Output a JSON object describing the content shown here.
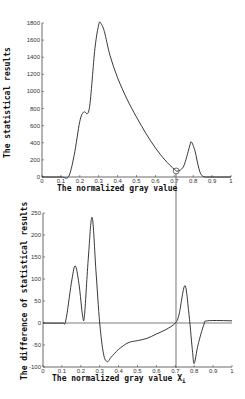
{
  "chart_data": [
    {
      "type": "line",
      "title": "",
      "xlabel": "The normalized gray value",
      "ylabel": "The statistical results",
      "xlim": [
        0,
        1
      ],
      "ylim": [
        0,
        1800
      ],
      "xticks": [
        "0",
        "0.1",
        "0.2",
        "0.3",
        "0.4",
        "0.5",
        "0.6",
        "0.7",
        "0.8",
        "0.9",
        "1"
      ],
      "yticks": [
        "0",
        "200",
        "400",
        "600",
        "800",
        "1000",
        "1200",
        "1400",
        "1600",
        "1800"
      ],
      "grid": false,
      "annotation": "circle marker at local minimum x≈0.71, y≈70",
      "x": [
        0,
        0.1,
        0.14,
        0.17,
        0.2,
        0.22,
        0.25,
        0.28,
        0.3,
        0.31,
        0.33,
        0.36,
        0.4,
        0.45,
        0.5,
        0.55,
        0.6,
        0.65,
        0.7,
        0.72,
        0.75,
        0.78,
        0.79,
        0.81,
        0.83,
        0.85,
        0.9,
        1
      ],
      "values": [
        0,
        0,
        5,
        250,
        650,
        760,
        800,
        1500,
        1780,
        1800,
        1700,
        1420,
        1160,
        910,
        700,
        510,
        340,
        200,
        90,
        70,
        130,
        350,
        410,
        300,
        100,
        10,
        0,
        0
      ]
    },
    {
      "type": "line",
      "title": "",
      "xlabel": "The normalized gray value Xi",
      "ylabel": "The difference of statistical results",
      "xlim": [
        0,
        1
      ],
      "ylim": [
        -100,
        250
      ],
      "xticks": [
        "0",
        "0.1",
        "0.2",
        "0.3",
        "0.4",
        "0.5",
        "0.6",
        "0.7",
        "0.8",
        "0.9",
        "1"
      ],
      "yticks": [
        "-100",
        "-50",
        "0",
        "50",
        "100",
        "150",
        "200",
        "250"
      ],
      "grid": false,
      "annotation": "vertical line at x≈0.71 linking both plots; horizontal line at y=0",
      "x": [
        0,
        0.1,
        0.12,
        0.15,
        0.17,
        0.19,
        0.21,
        0.22,
        0.24,
        0.26,
        0.28,
        0.3,
        0.32,
        0.34,
        0.36,
        0.4,
        0.45,
        0.5,
        0.55,
        0.6,
        0.65,
        0.7,
        0.72,
        0.75,
        0.77,
        0.79,
        0.8,
        0.82,
        0.85,
        0.87,
        1
      ],
      "values": [
        0,
        0,
        5,
        90,
        130,
        90,
        15,
        20,
        150,
        240,
        120,
        0,
        -70,
        -88,
        -78,
        -60,
        -45,
        -40,
        -35,
        -25,
        -15,
        0,
        20,
        85,
        30,
        -60,
        -92,
        -50,
        -5,
        5,
        5
      ]
    }
  ],
  "top_chart": {
    "xlabel": "The normalized gray value",
    "ylabel": "The statistical results"
  },
  "bottom_chart": {
    "xlabel": "The normalized gray value X",
    "xlabel_sub": "i",
    "ylabel": "The difference of statistical results"
  }
}
